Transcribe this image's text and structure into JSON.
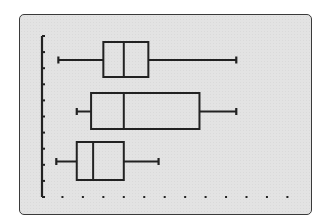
{
  "screen": {
    "background": "#e3e3e3",
    "border_color": "#3a3a3a",
    "ink_color": "#222222"
  },
  "chart_data": {
    "type": "boxplot",
    "orientation": "horizontal",
    "title": "",
    "xlabel": "",
    "ylabel": "",
    "x_tick_count": 12,
    "x_tick_style": "dots",
    "y_tick_count": 11,
    "xlim": [
      0,
      12
    ],
    "grid": false,
    "legend": null,
    "note": "No numeric labels shown; values are in x-axis dot units (dot spacing = 1), estimated from pixel positions.",
    "series": [
      {
        "name": "plot-1",
        "min": 0.8,
        "q1": 3.0,
        "median": 4.0,
        "q3": 5.2,
        "max": 9.5
      },
      {
        "name": "plot-2",
        "min": 1.7,
        "q1": 2.4,
        "median": 4.0,
        "q3": 7.7,
        "max": 9.5
      },
      {
        "name": "plot-3",
        "min": 0.7,
        "q1": 1.7,
        "median": 2.5,
        "q3": 4.0,
        "max": 5.7
      }
    ]
  }
}
